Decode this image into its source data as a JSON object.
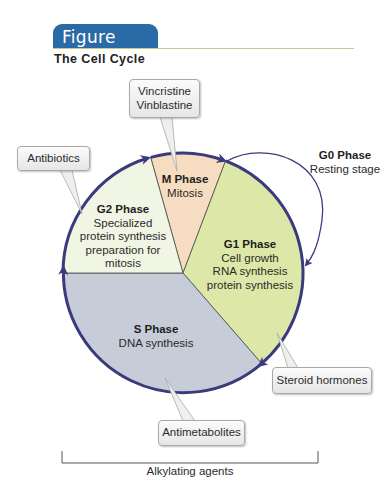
{
  "figure": {
    "number_label": "Figure 45.2",
    "title": "The Cell Cycle",
    "tab_color": "#2a6aa6",
    "rule_color": "#c9c98a"
  },
  "diagram": {
    "type": "cell-cycle-wheel",
    "outline_color": "#3b3a7d",
    "phases": [
      {
        "name": "M Phase",
        "description": "Mitosis",
        "color": "#f6dcc0"
      },
      {
        "name": "G1 Phase",
        "description_lines": [
          "Cell growth",
          "RNA synthesis",
          "protein synthesis"
        ],
        "color": "#dde8a8"
      },
      {
        "name": "S Phase",
        "description": "DNA synthesis",
        "color": "#c7ccd9"
      },
      {
        "name": "G2 Phase",
        "description_lines": [
          "Specialized",
          "protein synthesis",
          "preparation for",
          "mitosis"
        ],
        "color": "#f1f5e4"
      }
    ],
    "g0": {
      "name": "G0 Phase",
      "description": "Resting stage"
    },
    "callouts": {
      "m_phase_drugs": "Vincristine\nVinblastine",
      "g2_drugs": "Antibiotics",
      "g1_drugs": "Steroid hormones",
      "s_drugs": "Antimetabolites"
    },
    "bracket_label": "Alkylating agents"
  }
}
